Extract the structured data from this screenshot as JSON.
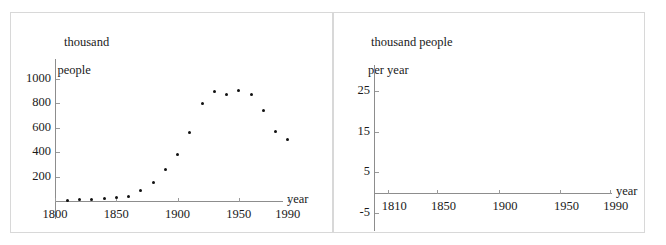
{
  "figure": {
    "background": "#ffffff",
    "frame_color": "#d8d8d8",
    "axis_color": "#8d8d8d",
    "dot_color": "#111111"
  },
  "panels": [
    {
      "name": "population-scatter",
      "axis_title_line1": "thousand",
      "axis_title_line2": "people",
      "x_axis_name": "year"
    },
    {
      "name": "growth-rate-empty-axes",
      "axis_title_line1": "thousand people",
      "axis_title_line2": "per year",
      "x_axis_name": "year"
    }
  ],
  "chart_data": [
    {
      "type": "scatter",
      "title": "",
      "xlabel": "year",
      "ylabel": "thousand people",
      "xlim": [
        1800,
        2000
      ],
      "ylim": [
        0,
        1080
      ],
      "xticks": [
        1800,
        1850,
        1900,
        1950,
        1990
      ],
      "xticklabels": [
        "1800",
        "1850",
        "1900",
        "1950",
        "1990"
      ],
      "yticks": [
        200,
        400,
        600,
        800,
        1000
      ],
      "yticklabels": [
        "200",
        "400",
        "600",
        "800",
        "1000"
      ],
      "grid": false,
      "legend": null,
      "x": [
        1810,
        1820,
        1830,
        1840,
        1850,
        1860,
        1870,
        1880,
        1890,
        1900,
        1910,
        1920,
        1930,
        1940,
        1950,
        1960,
        1970,
        1980,
        1990
      ],
      "y": [
        8,
        12,
        15,
        20,
        25,
        40,
        90,
        155,
        260,
        380,
        560,
        795,
        895,
        875,
        905,
        870,
        740,
        570,
        500
      ]
    },
    {
      "type": "scatter",
      "title": "",
      "xlabel": "year",
      "ylabel": "thousand people per year",
      "xlim": [
        1805,
        2000
      ],
      "ylim": [
        -5,
        29
      ],
      "xticks": [
        1810,
        1850,
        1900,
        1950,
        1990
      ],
      "xticklabels": [
        "1810",
        "1850",
        "1900",
        "1950",
        "1990"
      ],
      "yticks": [
        -5,
        5,
        15,
        25
      ],
      "yticklabels": [
        "-5",
        "5",
        "15",
        "25"
      ],
      "grid": false,
      "legend": null,
      "x": [],
      "y": []
    }
  ]
}
